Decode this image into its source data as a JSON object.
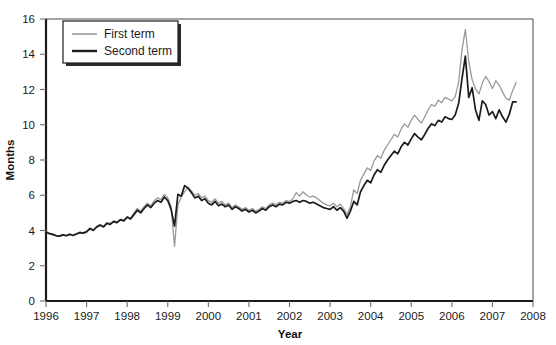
{
  "chart_data": {
    "type": "line",
    "title": "",
    "xlabel": "Year",
    "ylabel": "Months",
    "xlim": [
      1996,
      2008
    ],
    "ylim": [
      0,
      16
    ],
    "grid": false,
    "legend_position": "top-left",
    "xticks": [
      "1996",
      "1997",
      "1998",
      "1999",
      "2000",
      "2001",
      "2002",
      "2003",
      "2004",
      "2005",
      "2006",
      "2007",
      "2008"
    ],
    "yticks": [
      "0",
      "2",
      "4",
      "6",
      "8",
      "10",
      "12",
      "14",
      "16"
    ],
    "series": [
      {
        "name": "First term",
        "color": "#9a9a9a",
        "width": 1.3,
        "x": [
          1996.0,
          1996.083,
          1996.167,
          1996.25,
          1996.333,
          1996.417,
          1996.5,
          1996.583,
          1996.667,
          1996.75,
          1996.833,
          1996.917,
          1997.0,
          1997.083,
          1997.167,
          1997.25,
          1997.333,
          1997.417,
          1997.5,
          1997.583,
          1997.667,
          1997.75,
          1997.833,
          1997.917,
          1998.0,
          1998.083,
          1998.167,
          1998.25,
          1998.333,
          1998.417,
          1998.5,
          1998.583,
          1998.667,
          1998.75,
          1998.833,
          1998.917,
          1999.0,
          1999.083,
          1999.167,
          1999.25,
          1999.333,
          1999.417,
          1999.5,
          1999.583,
          1999.667,
          1999.75,
          1999.833,
          1999.917,
          2000.0,
          2000.083,
          2000.167,
          2000.25,
          2000.333,
          2000.417,
          2000.5,
          2000.583,
          2000.667,
          2000.75,
          2000.833,
          2000.917,
          2001.0,
          2001.083,
          2001.167,
          2001.25,
          2001.333,
          2001.417,
          2001.5,
          2001.583,
          2001.667,
          2001.75,
          2001.833,
          2001.917,
          2002.0,
          2002.083,
          2002.167,
          2002.25,
          2002.333,
          2002.417,
          2002.5,
          2002.583,
          2002.667,
          2002.75,
          2002.833,
          2002.917,
          2003.0,
          2003.083,
          2003.167,
          2003.25,
          2003.333,
          2003.417,
          2003.5,
          2003.583,
          2003.667,
          2003.75,
          2003.833,
          2003.917,
          2004.0,
          2004.083,
          2004.167,
          2004.25,
          2004.333,
          2004.417,
          2004.5,
          2004.583,
          2004.667,
          2004.75,
          2004.833,
          2004.917,
          2005.0,
          2005.083,
          2005.167,
          2005.25,
          2005.333,
          2005.417,
          2005.5,
          2005.583,
          2005.667,
          2005.75,
          2005.833,
          2005.917,
          2006.0,
          2006.083,
          2006.167,
          2006.25,
          2006.333,
          2006.417,
          2006.5,
          2006.583,
          2006.667,
          2006.75,
          2006.833,
          2006.917,
          2007.0,
          2007.083,
          2007.167,
          2007.25,
          2007.333,
          2007.417,
          2007.5,
          2007.583
        ],
        "y": [
          3.95,
          3.85,
          3.75,
          3.72,
          3.7,
          3.78,
          3.72,
          3.8,
          3.75,
          3.82,
          3.9,
          3.88,
          3.95,
          4.15,
          4.05,
          4.25,
          4.35,
          4.25,
          4.45,
          4.4,
          4.55,
          4.5,
          4.65,
          4.6,
          4.8,
          4.7,
          5.0,
          5.25,
          5.1,
          5.35,
          5.55,
          5.4,
          5.7,
          5.85,
          5.75,
          6.05,
          5.85,
          5.35,
          3.1,
          5.45,
          5.9,
          6.2,
          6.45,
          6.25,
          6.0,
          6.1,
          5.85,
          5.95,
          5.7,
          5.6,
          5.8,
          5.55,
          5.65,
          5.45,
          5.55,
          5.3,
          5.45,
          5.35,
          5.2,
          5.3,
          5.15,
          5.25,
          5.1,
          5.2,
          5.35,
          5.25,
          5.45,
          5.55,
          5.45,
          5.6,
          5.55,
          5.7,
          5.65,
          5.8,
          6.15,
          5.95,
          6.2,
          6.0,
          5.9,
          5.95,
          5.85,
          5.7,
          5.55,
          5.45,
          5.4,
          5.55,
          5.35,
          5.5,
          5.25,
          4.9,
          5.35,
          6.3,
          6.1,
          6.85,
          7.2,
          7.55,
          7.4,
          7.95,
          8.25,
          8.1,
          8.55,
          8.85,
          9.15,
          9.45,
          9.3,
          9.75,
          10.05,
          9.85,
          10.25,
          10.55,
          10.3,
          10.1,
          10.45,
          10.85,
          11.15,
          11.05,
          11.4,
          11.25,
          11.55,
          11.45,
          11.35,
          11.6,
          12.4,
          14.25,
          15.4,
          13.6,
          12.55,
          12.05,
          11.75,
          12.35,
          12.75,
          12.45,
          12.05,
          12.5,
          12.25,
          11.85,
          11.5,
          11.4,
          11.95,
          12.4
        ]
      },
      {
        "name": "Second term",
        "color": "#1b1b1b",
        "width": 1.7,
        "x": [
          1996.0,
          1996.083,
          1996.167,
          1996.25,
          1996.333,
          1996.417,
          1996.5,
          1996.583,
          1996.667,
          1996.75,
          1996.833,
          1996.917,
          1997.0,
          1997.083,
          1997.167,
          1997.25,
          1997.333,
          1997.417,
          1997.5,
          1997.583,
          1997.667,
          1997.75,
          1997.833,
          1997.917,
          1998.0,
          1998.083,
          1998.167,
          1998.25,
          1998.333,
          1998.417,
          1998.5,
          1998.583,
          1998.667,
          1998.75,
          1998.833,
          1998.917,
          1999.0,
          1999.083,
          1999.167,
          1999.25,
          1999.333,
          1999.417,
          1999.5,
          1999.583,
          1999.667,
          1999.75,
          1999.833,
          1999.917,
          2000.0,
          2000.083,
          2000.167,
          2000.25,
          2000.333,
          2000.417,
          2000.5,
          2000.583,
          2000.667,
          2000.75,
          2000.833,
          2000.917,
          2001.0,
          2001.083,
          2001.167,
          2001.25,
          2001.333,
          2001.417,
          2001.5,
          2001.583,
          2001.667,
          2001.75,
          2001.833,
          2001.917,
          2002.0,
          2002.083,
          2002.167,
          2002.25,
          2002.333,
          2002.417,
          2002.5,
          2002.583,
          2002.667,
          2002.75,
          2002.833,
          2002.917,
          2003.0,
          2003.083,
          2003.167,
          2003.25,
          2003.333,
          2003.417,
          2003.5,
          2003.583,
          2003.667,
          2003.75,
          2003.833,
          2003.917,
          2004.0,
          2004.083,
          2004.167,
          2004.25,
          2004.333,
          2004.417,
          2004.5,
          2004.583,
          2004.667,
          2004.75,
          2004.833,
          2004.917,
          2005.0,
          2005.083,
          2005.167,
          2005.25,
          2005.333,
          2005.417,
          2005.5,
          2005.583,
          2005.667,
          2005.75,
          2005.833,
          2005.917,
          2006.0,
          2006.083,
          2006.167,
          2006.25,
          2006.333,
          2006.417,
          2006.5,
          2006.583,
          2006.667,
          2006.75,
          2006.833,
          2006.917,
          2007.0,
          2007.083,
          2007.167,
          2007.25,
          2007.333,
          2007.417,
          2007.5,
          2007.583
        ],
        "y": [
          3.92,
          3.82,
          3.78,
          3.7,
          3.68,
          3.75,
          3.7,
          3.78,
          3.72,
          3.8,
          3.88,
          3.85,
          3.92,
          4.1,
          4.0,
          4.2,
          4.3,
          4.2,
          4.4,
          4.35,
          4.5,
          4.45,
          4.6,
          4.55,
          4.75,
          4.65,
          4.9,
          5.15,
          5.0,
          5.25,
          5.45,
          5.3,
          5.55,
          5.7,
          5.6,
          5.9,
          5.7,
          5.2,
          4.25,
          6.05,
          5.95,
          6.55,
          6.4,
          6.15,
          5.85,
          5.95,
          5.7,
          5.8,
          5.55,
          5.45,
          5.65,
          5.4,
          5.5,
          5.35,
          5.45,
          5.2,
          5.35,
          5.25,
          5.1,
          5.2,
          5.05,
          5.15,
          5.0,
          5.1,
          5.25,
          5.15,
          5.35,
          5.45,
          5.35,
          5.5,
          5.45,
          5.6,
          5.55,
          5.65,
          5.7,
          5.6,
          5.7,
          5.65,
          5.55,
          5.6,
          5.5,
          5.4,
          5.3,
          5.25,
          5.2,
          5.35,
          5.15,
          5.3,
          5.1,
          4.7,
          5.1,
          5.65,
          5.45,
          6.2,
          6.55,
          6.85,
          6.7,
          7.15,
          7.45,
          7.3,
          7.7,
          8.0,
          8.25,
          8.5,
          8.35,
          8.75,
          9.0,
          8.85,
          9.2,
          9.5,
          9.3,
          9.15,
          9.45,
          9.8,
          10.05,
          9.95,
          10.25,
          10.15,
          10.45,
          10.35,
          10.3,
          10.55,
          11.2,
          12.6,
          13.9,
          11.55,
          12.1,
          10.85,
          10.25,
          11.35,
          11.15,
          10.55,
          10.75,
          10.35,
          10.85,
          10.45,
          10.15,
          10.6,
          11.3,
          11.3
        ]
      }
    ]
  },
  "legend": {
    "items": [
      {
        "label": "First term"
      },
      {
        "label": "Second term"
      }
    ]
  }
}
